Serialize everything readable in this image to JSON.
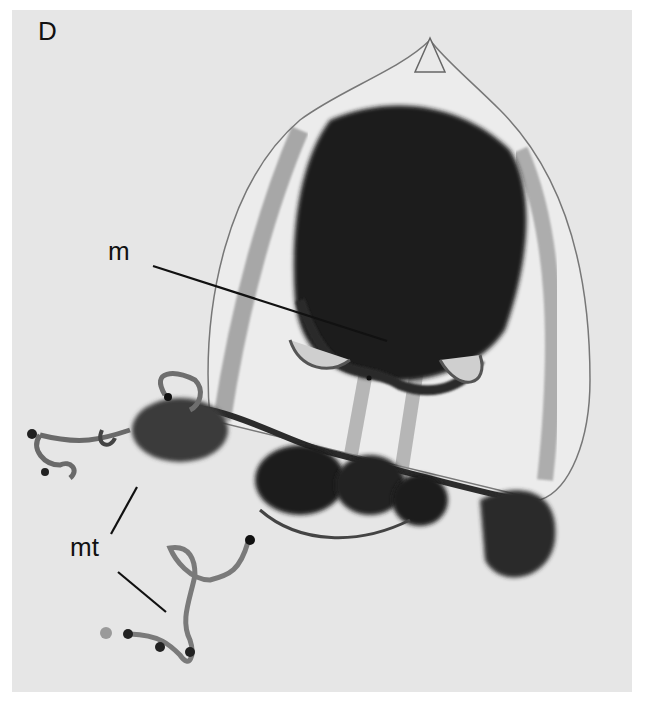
{
  "figure": {
    "panel_letter": "D",
    "labels": [
      {
        "id": "m",
        "text": "m"
      },
      {
        "id": "mt",
        "text": "mt"
      }
    ],
    "colors": {
      "background": "#e6e6e6",
      "specimen_dark": "#1a1a1a",
      "specimen_mid": "#6a6a6a",
      "outline": "#555555"
    }
  }
}
